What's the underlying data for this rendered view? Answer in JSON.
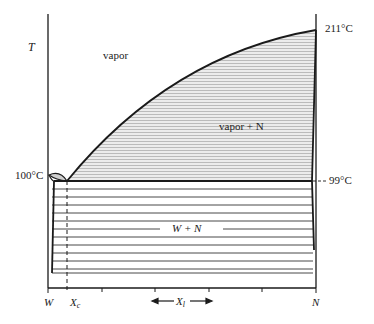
{
  "diagram": {
    "type": "phase-diagram",
    "axis_y_label": "T",
    "axis_x_label": "X",
    "axis_x_label_subscript": "l",
    "axis_x_left_end": "W",
    "axis_x_right_end": "N",
    "xc_label": "X",
    "xc_subscript": "c",
    "temperatures": {
      "left_boiling": "100°C",
      "right_boiling": "211°C",
      "three_phase": "99°C"
    },
    "regions": {
      "vapor": "vapor",
      "vapor_plus_n": "vapor + N",
      "w_plus_n": "W + N"
    },
    "colors": {
      "line": "#1a1a1a",
      "hatch": "#8a8a8a",
      "region_fill": "#e9e9e9",
      "background": "#ffffff"
    }
  }
}
